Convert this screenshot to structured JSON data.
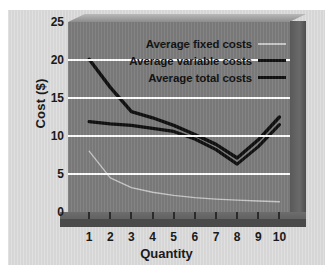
{
  "chart_data": {
    "type": "line",
    "title": "",
    "xlabel": "Quantity",
    "ylabel": "Cost ($)",
    "xlim": [
      0,
      10.5
    ],
    "ylim": [
      0,
      25
    ],
    "x": [
      1,
      2,
      3,
      4,
      5,
      6,
      7,
      8,
      9,
      10
    ],
    "xticklabels": [
      "1",
      "2",
      "3",
      "4",
      "5",
      "6",
      "7",
      "8",
      "9",
      "10"
    ],
    "yticks": [
      0,
      5,
      10,
      15,
      20,
      25
    ],
    "yticklabels": [
      "0",
      "5",
      "10",
      "15",
      "20",
      "25"
    ],
    "grid": "horizontal-white",
    "legend_position": "upper-right-inside",
    "series": [
      {
        "name": "Average fixed costs",
        "style": "thin-light",
        "color": "#c9c9c9",
        "values": [
          8.0,
          4.5,
          3.2,
          2.6,
          2.2,
          1.9,
          1.7,
          1.55,
          1.45,
          1.35
        ]
      },
      {
        "name": "Average variable costs",
        "style": "thick-dark",
        "color": "#111111",
        "values": [
          11.9,
          11.6,
          11.4,
          11.0,
          10.6,
          9.6,
          8.2,
          6.3,
          8.6,
          11.5
        ]
      },
      {
        "name": "Average total costs",
        "style": "thick-dark",
        "color": "#111111",
        "values": [
          20.1,
          16.4,
          13.2,
          12.4,
          11.4,
          10.2,
          8.9,
          7.1,
          9.5,
          12.5
        ]
      }
    ]
  },
  "axes": {
    "ylabel_text": "Cost ($)",
    "xlabel_text": "Quantity",
    "yticks": [
      {
        "value": "25"
      },
      {
        "value": "20"
      },
      {
        "value": "15"
      },
      {
        "value": "10"
      },
      {
        "value": "5"
      },
      {
        "value": "0"
      }
    ],
    "xticks": [
      {
        "value": "1"
      },
      {
        "value": "2"
      },
      {
        "value": "3"
      },
      {
        "value": "4"
      },
      {
        "value": "5"
      },
      {
        "value": "6"
      },
      {
        "value": "7"
      },
      {
        "value": "8"
      },
      {
        "value": "9"
      },
      {
        "value": "10"
      }
    ]
  },
  "legend": {
    "entries": [
      {
        "label": "Average fixed costs"
      },
      {
        "label": "Average variable costs"
      },
      {
        "label": "Average total costs"
      }
    ]
  },
  "colors": {
    "plot_background": "#7d7d7d",
    "panel_background": "#d6d6d6",
    "gridline": "#ffffff",
    "curve_dark": "#111111",
    "curve_light": "#c9c9c9",
    "text": "#1a1a1a"
  }
}
